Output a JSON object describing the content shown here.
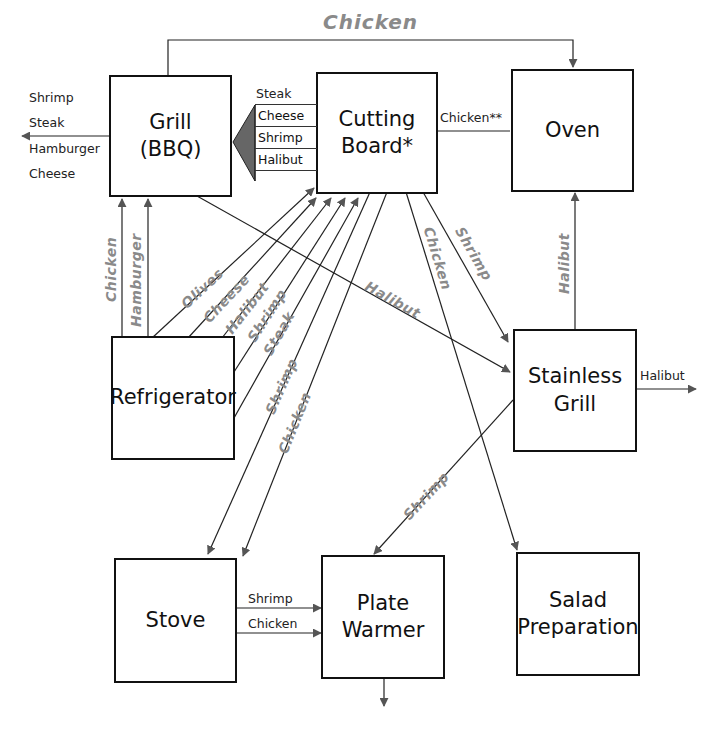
{
  "nodes": {
    "grill_bbq": "Grill\n(BBQ)",
    "grill_bbq_l1": "Grill",
    "grill_bbq_l2": "(BBQ)",
    "cutting_board_l1": "Cutting",
    "cutting_board_l2": "Board*",
    "oven": "Oven",
    "refrigerator": "Refrigerator",
    "stainless_grill_l1": "Stainless",
    "stainless_grill_l2": "Grill",
    "stove": "Stove",
    "plate_warmer_l1": "Plate",
    "plate_warmer_l2": "Warmer",
    "salad_prep_l1": "Salad",
    "salad_prep_l2": "Preparation"
  },
  "labels": {
    "top_chicken": "Chicken",
    "grill_out": [
      "Shrimp",
      "Steak",
      "Hamburger",
      "Cheese"
    ],
    "board_to_grill": [
      "Steak",
      "Cheese",
      "Shrimp",
      "Halibut"
    ],
    "oven_to_board": "Chicken**",
    "stainless_out": "Halibut",
    "stove_to_warmer": [
      "Shrimp",
      "Chicken"
    ],
    "fridge_to_grill": [
      "Chicken",
      "Hamburger"
    ],
    "fridge_to_board": [
      "Olives",
      "Cheese",
      "Halibut",
      "Shrimp",
      "Steak"
    ],
    "board_to_stove": [
      "Shrimp",
      "Chicken"
    ],
    "grill_to_stainless": "Halibut",
    "board_to_salad": "Chicken",
    "board_to_stainless": "Shrimp",
    "stainless_to_oven": "Halibut",
    "stainless_to_warmer": "Shrimp"
  }
}
